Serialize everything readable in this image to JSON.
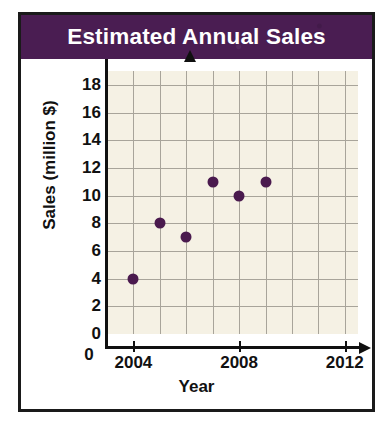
{
  "chart_data": {
    "type": "scatter",
    "title": "Estimated Annual Sales",
    "xlabel": "Year",
    "ylabel": "Sales (million $)",
    "x": [
      2004,
      2005,
      2006,
      2007,
      2008,
      2009
    ],
    "values": [
      4,
      8,
      7,
      11,
      10,
      11
    ],
    "points": [
      {
        "x": 2004,
        "y": 4
      },
      {
        "x": 2005,
        "y": 8
      },
      {
        "x": 2006,
        "y": 7
      },
      {
        "x": 2007,
        "y": 11
      },
      {
        "x": 2008,
        "y": 10
      },
      {
        "x": 2009,
        "y": 11
      }
    ],
    "xlim": [
      2003,
      2012.5
    ],
    "ylim": [
      0,
      19
    ],
    "x_tick_labels": [
      "2004",
      "2008",
      "2012"
    ],
    "x_tick_values": [
      2004,
      2008,
      2012
    ],
    "x_gridline_values": [
      2004,
      2005,
      2006,
      2007,
      2008,
      2009,
      2010,
      2011,
      2012
    ],
    "y_tick_labels": [
      "0",
      "2",
      "4",
      "6",
      "8",
      "10",
      "12",
      "14",
      "16",
      "18"
    ],
    "y_tick_values": [
      0,
      2,
      4,
      6,
      8,
      10,
      12,
      14,
      16,
      18
    ],
    "grid": true,
    "legend": null,
    "colors": {
      "title_bar": "#4a1d52",
      "title_text": "#ffffff",
      "plot_background": "#f5f1e4",
      "gridline": "#a8a49a",
      "axis": "#101010",
      "marker": "#4a1a4e",
      "frame": "#1a1a1a"
    }
  }
}
